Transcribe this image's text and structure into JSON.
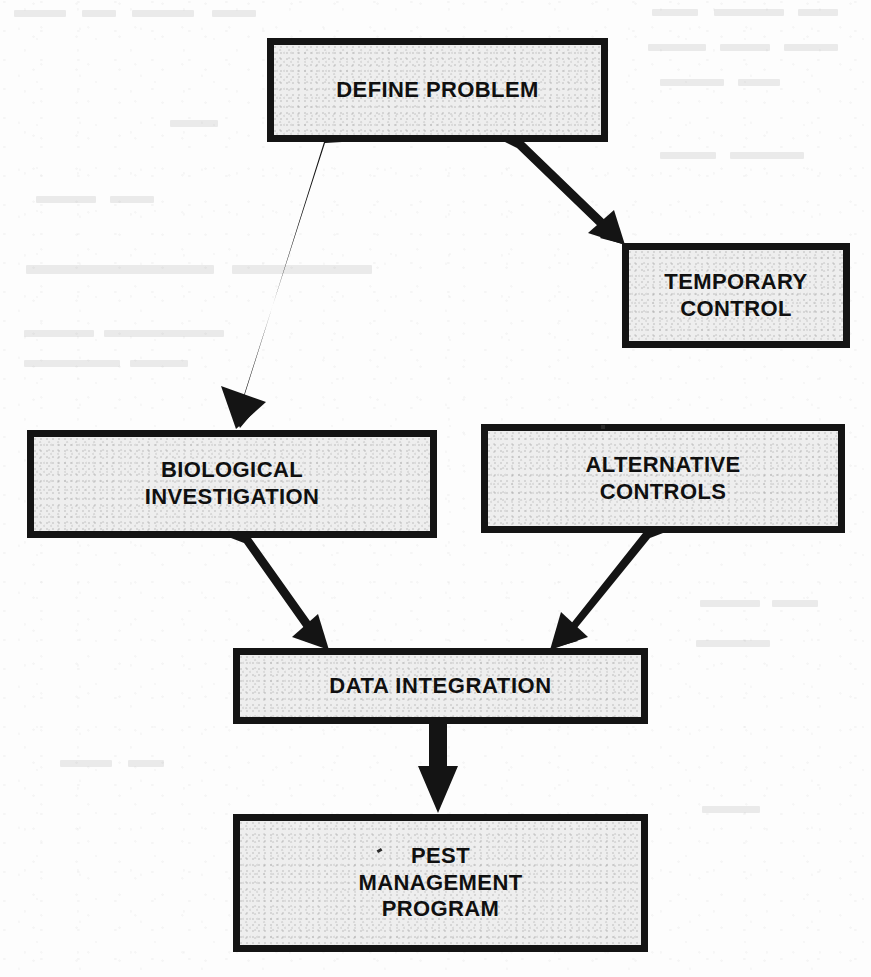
{
  "diagram": {
    "background_color": "#fdfdfd",
    "box_fill_color": "#eeeeee",
    "box_border_color": "#141414",
    "arrow_color": "#141414",
    "nodes": [
      {
        "id": "define-problem",
        "label": "DEFINE PROBLEM",
        "x": 267,
        "y": 38,
        "width": 341,
        "height": 104
      },
      {
        "id": "temporary-control",
        "label": "TEMPORARY\nCONTROL",
        "x": 622,
        "y": 243,
        "width": 228,
        "height": 105
      },
      {
        "id": "biological-investigation",
        "label": "BIOLOGICAL\nINVESTIGATION",
        "x": 27,
        "y": 430,
        "width": 410,
        "height": 108
      },
      {
        "id": "alternative-controls",
        "label": "ALTERNATIVE\nCONTROLS",
        "x": 481,
        "y": 424,
        "width": 364,
        "height": 109
      },
      {
        "id": "data-integration",
        "label": "DATA INTEGRATION",
        "x": 233,
        "y": 648,
        "width": 415,
        "height": 76
      },
      {
        "id": "pest-management-program",
        "label": "PEST\nMANAGEMENT\nPROGRAM",
        "x": 233,
        "y": 814,
        "width": 415,
        "height": 138
      }
    ],
    "edges": [
      {
        "id": "define-to-biological",
        "from": "define-problem",
        "to": "biological-investigation"
      },
      {
        "id": "define-to-temporary",
        "from": "define-problem",
        "to": "temporary-control"
      },
      {
        "id": "biological-to-data",
        "from": "biological-investigation",
        "to": "data-integration"
      },
      {
        "id": "alternative-to-data",
        "from": "alternative-controls",
        "to": "data-integration"
      },
      {
        "id": "data-to-pest",
        "from": "data-integration",
        "to": "pest-management-program"
      }
    ]
  }
}
